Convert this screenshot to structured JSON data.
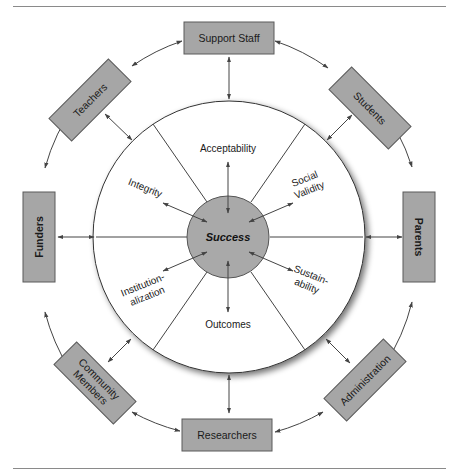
{
  "figure": {
    "center": {
      "label": "Success",
      "fill": "#a9a9a9"
    },
    "dimensions": [
      {
        "id": "acceptability",
        "lines": [
          "Acceptability"
        ]
      },
      {
        "id": "social-validity",
        "lines": [
          "Social",
          "Validity"
        ]
      },
      {
        "id": "sustainability",
        "lines": [
          "Sustain-",
          "ability"
        ]
      },
      {
        "id": "outcomes",
        "lines": [
          "Outcomes"
        ]
      },
      {
        "id": "institutionalization",
        "lines": [
          "Institution-",
          "alization"
        ]
      },
      {
        "id": "integrity",
        "lines": [
          "Integrity"
        ]
      }
    ],
    "stakeholders": [
      {
        "id": "support-staff",
        "lines": [
          "Support Staff"
        ]
      },
      {
        "id": "students",
        "lines": [
          "Students"
        ]
      },
      {
        "id": "parents",
        "lines": [
          "Parents"
        ]
      },
      {
        "id": "administration",
        "lines": [
          "Administration"
        ]
      },
      {
        "id": "researchers",
        "lines": [
          "Researchers"
        ]
      },
      {
        "id": "community-members",
        "lines": [
          "Community",
          "Members"
        ]
      },
      {
        "id": "funders",
        "lines": [
          "Funders"
        ]
      },
      {
        "id": "teachers",
        "lines": [
          "Teachers"
        ]
      }
    ],
    "colors": {
      "box_fill": "#a6a6a6",
      "box_stroke": "#5a5a5a",
      "line": "#444444",
      "rule": "#8a8a8a"
    }
  }
}
